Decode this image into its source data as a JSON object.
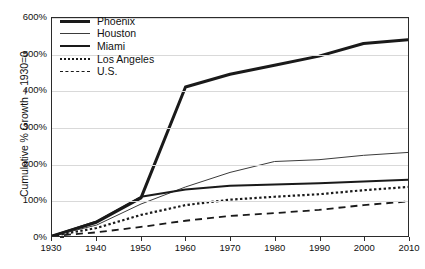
{
  "chart_data": {
    "type": "line",
    "title": "",
    "xlabel": "",
    "ylabel": "Cumulative % Growth – 1930=0",
    "x": [
      1930,
      1940,
      1950,
      1960,
      1970,
      1980,
      1990,
      2000,
      2010
    ],
    "xlim": [
      1930,
      2010
    ],
    "ylim": [
      0,
      600
    ],
    "grid": true,
    "legend_position": "top-left",
    "x_tick_labels": [
      "1930",
      "1940",
      "1950",
      "1960",
      "1970",
      "1980",
      "1990",
      "2000",
      "2010"
    ],
    "y_tick_labels": [
      "0%",
      "100%",
      "200%",
      "300%",
      "400%",
      "500%",
      "600%"
    ],
    "y_ticks": [
      0,
      100,
      200,
      300,
      400,
      500,
      600
    ],
    "series": [
      {
        "name": "Phoenix",
        "style": "solid-thick",
        "color": "#1a1a1a",
        "values": [
          0,
          38,
          105,
          410,
          445,
          470,
          495,
          530,
          540
        ]
      },
      {
        "name": "Houston",
        "style": "solid-thin",
        "color": "#3b3b3b",
        "values": [
          0,
          30,
          88,
          135,
          175,
          205,
          210,
          222,
          230
        ]
      },
      {
        "name": "Miami",
        "style": "solid-medium",
        "color": "#1a1a1a",
        "values": [
          0,
          40,
          108,
          128,
          138,
          142,
          145,
          150,
          155
        ]
      },
      {
        "name": "Los Angeles",
        "style": "dotted",
        "color": "#1a1a1a",
        "values": [
          0,
          22,
          58,
          85,
          100,
          108,
          115,
          126,
          135
        ]
      },
      {
        "name": "U.S.",
        "style": "dashed",
        "color": "#1a1a1a",
        "values": [
          0,
          10,
          25,
          42,
          55,
          63,
          72,
          85,
          95
        ]
      }
    ]
  },
  "legend": {
    "items": [
      {
        "label": "Phoenix"
      },
      {
        "label": "Houston"
      },
      {
        "label": "Miami"
      },
      {
        "label": "Los Angeles"
      },
      {
        "label": "U.S."
      }
    ]
  }
}
